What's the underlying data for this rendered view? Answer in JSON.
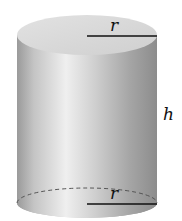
{
  "diagram": {
    "shape": "cylinder",
    "labels": {
      "top_radius": "r",
      "bottom_radius": "r",
      "height": "h"
    },
    "colors": {
      "body_dark": "#8a8a8a",
      "body_light": "#ececec",
      "top_face": "#d8d8d8",
      "bottom_face": "#b0b0b0",
      "line": "#111111"
    }
  }
}
